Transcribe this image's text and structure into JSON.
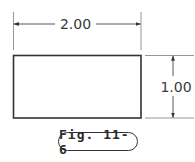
{
  "figure": {
    "caption": "Fig. 11-6",
    "shape": "rectangle",
    "dimensions": {
      "width_label": "2.00",
      "height_label": "1.00"
    },
    "colors": {
      "line": "#333333",
      "extension_line": "#8a8a8a",
      "text": "#3a3a3a",
      "background": "#ffffff"
    }
  }
}
